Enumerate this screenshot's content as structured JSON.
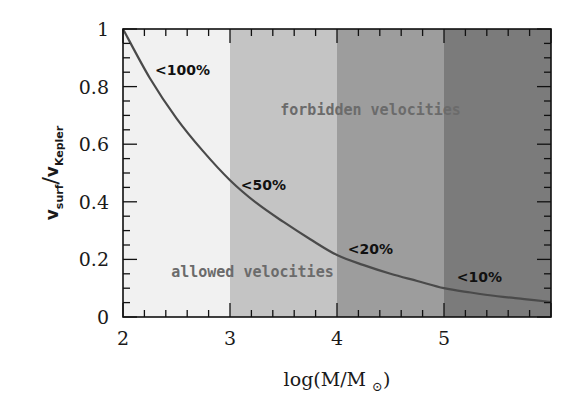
{
  "chart_data": {
    "type": "line",
    "title": "",
    "xlabel": "log(M/M⊙)",
    "ylabel": "v_surf / v_Kepler",
    "ylabel_parts": {
      "main1": "v",
      "sub1": "surf",
      "slash": "/",
      "main2": "v",
      "sub2": "Kepler"
    },
    "xlim": [
      2,
      6
    ],
    "ylim": [
      0,
      1
    ],
    "x_ticks": [
      2,
      3,
      4,
      5
    ],
    "x_tick_labels": [
      "2",
      "3",
      "4",
      "5"
    ],
    "y_ticks": [
      0,
      0.2,
      0.4,
      0.6,
      0.8,
      1
    ],
    "y_tick_labels": [
      "0",
      "0.2",
      "0.4",
      "0.6",
      "0.8",
      "1"
    ],
    "grid": false,
    "legend": null,
    "series": [
      {
        "name": "v_surf/v_Kepler limit",
        "x": [
          2.0,
          2.25,
          2.5,
          2.75,
          3.0,
          3.25,
          3.5,
          3.75,
          4.0,
          4.25,
          4.5,
          4.75,
          5.0,
          5.25,
          5.5,
          5.75,
          6.0
        ],
        "y": [
          1.0,
          0.83,
          0.69,
          0.575,
          0.475,
          0.395,
          0.33,
          0.27,
          0.215,
          0.18,
          0.15,
          0.125,
          0.1,
          0.085,
          0.072,
          0.062,
          0.052
        ],
        "color": "#4a4a4a"
      }
    ],
    "bands": [
      {
        "x0": 2,
        "x1": 3,
        "color": "#f1f1f1"
      },
      {
        "x0": 3,
        "x1": 4,
        "color": "#c4c4c4"
      },
      {
        "x0": 4,
        "x1": 5,
        "color": "#9d9d9d"
      },
      {
        "x0": 5,
        "x1": 6,
        "color": "#7b7b7b"
      }
    ],
    "annotations": [
      {
        "text": "<100%",
        "x": 2.3,
        "y": 0.84
      },
      {
        "text": "<50%",
        "x": 3.1,
        "y": 0.44
      },
      {
        "text": "<20%",
        "x": 4.1,
        "y": 0.22
      },
      {
        "text": "<10%",
        "x": 5.12,
        "y": 0.12
      },
      {
        "text": "forbidden velocities",
        "x": 3.47,
        "y": 0.7,
        "kind": "region"
      },
      {
        "text": "allowed velocities",
        "x": 2.45,
        "y": 0.14,
        "kind": "region"
      }
    ]
  }
}
